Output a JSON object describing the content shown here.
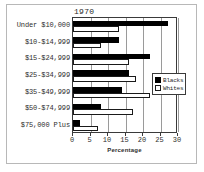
{
  "chart_data": {
    "type": "bar",
    "orientation": "horizontal",
    "title": "1970",
    "xlabel": "Percentage",
    "ylabel": "",
    "xlim": [
      0,
      30
    ],
    "xticks": [
      0,
      5,
      10,
      15,
      20,
      25,
      30
    ],
    "grid": true,
    "legend_position": "right",
    "categories": [
      "Under $10,000",
      "$10-$14,999",
      "$15-$24,999",
      "$25-$34,999",
      "$35-$49,999",
      "$50-$74,999",
      "$75,000 Plus"
    ],
    "series": [
      {
        "name": "Blacks",
        "color": "#000000",
        "values": [
          27,
          13,
          22,
          16,
          14,
          8,
          2
        ]
      },
      {
        "name": "Whites",
        "color": "#ffffff",
        "values": [
          13,
          8,
          16,
          18,
          22,
          17,
          7
        ]
      }
    ]
  },
  "legend": {
    "entries": [
      {
        "label": "Blacks",
        "swatch": "blacks"
      },
      {
        "label": "Whites",
        "swatch": "whites"
      }
    ]
  }
}
